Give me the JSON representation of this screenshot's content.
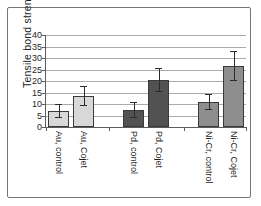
{
  "figure": {
    "background": "#ffffff",
    "frame_border_color": "#777777"
  },
  "chart_data": {
    "type": "bar",
    "title": "",
    "ylabel": "Tensile bond strength (MPa)",
    "xlabel": "",
    "ylim": [
      0,
      40
    ],
    "yticks": [
      0,
      5,
      10,
      15,
      20,
      25,
      30,
      35,
      40
    ],
    "grid": true,
    "legend": "none",
    "categories": [
      "Au, control",
      "Au, Cojet",
      "Pd, control",
      "Pd, Cojet",
      "Ni-Cr, control",
      "Ni-Cr, Cojet"
    ],
    "values": [
      7,
      13.5,
      7.4,
      20.5,
      11,
      26.5
    ],
    "error_bars": [
      3,
      4.2,
      3.3,
      5.1,
      3.5,
      6.7
    ],
    "bar_colors": [
      "#d8d8d8",
      "#d8d8d8",
      "#525252",
      "#525252",
      "#8e8e8e",
      "#8e8e8e"
    ],
    "bar_border_color": "#3a3a3a",
    "gridline_color": "#ababab",
    "axis_color": "#5c5c5c",
    "error_bar_color": "#2b2b2b",
    "text_color": "#1f1f1f"
  }
}
